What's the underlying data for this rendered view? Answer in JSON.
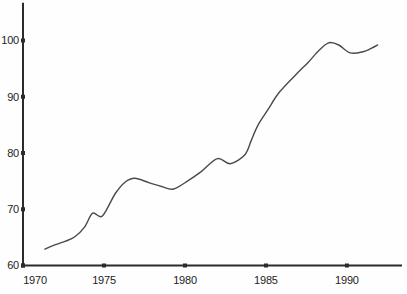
{
  "figure": {
    "background": "#fefefe",
    "axis_color": "#2b2b2b",
    "line_color": "#4a4a4a",
    "label_color": "#1c1c1c"
  },
  "chart_data": {
    "type": "line",
    "title": "",
    "xlabel": "",
    "ylabel": "",
    "grid": false,
    "legend": null,
    "xlim": [
      1970,
      1993.4
    ],
    "ylim": [
      60,
      106.7
    ],
    "x_ticks": [
      1970,
      1975,
      1980,
      1985,
      1990
    ],
    "x_tick_labels": [
      "1970",
      "1975",
      "1980",
      "1985",
      "1990"
    ],
    "y_ticks": [
      60,
      70,
      80,
      90,
      100
    ],
    "y_tick_labels": [
      "60",
      "70",
      "80",
      "90",
      "100"
    ],
    "series": [
      {
        "name": "index-line",
        "x": [
          1971.35,
          1972.0,
          1972.6,
          1973.2,
          1973.8,
          1974.3,
          1974.9,
          1975.7,
          1976.3,
          1976.9,
          1977.8,
          1978.6,
          1979.3,
          1980.2,
          1981.0,
          1982.0,
          1982.8,
          1983.7,
          1984.1,
          1984.5,
          1985.1,
          1985.8,
          1986.8,
          1987.6,
          1988.3,
          1988.9,
          1989.5,
          1990.2,
          1991.0,
          1991.5,
          1991.9
        ],
        "y": [
          62.9,
          63.7,
          64.3,
          65.1,
          66.8,
          69.3,
          68.8,
          72.8,
          74.8,
          75.5,
          74.7,
          74.0,
          73.6,
          75.1,
          76.7,
          79.0,
          78.1,
          79.7,
          82.3,
          84.9,
          87.6,
          90.7,
          93.8,
          96.1,
          98.3,
          99.6,
          99.2,
          97.8,
          98.0,
          98.6,
          99.2
        ]
      }
    ]
  }
}
